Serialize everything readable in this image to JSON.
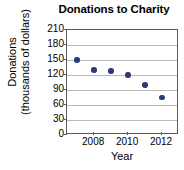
{
  "chart_data": {
    "type": "scatter",
    "title": "Donations to Charity",
    "xlabel": "Year",
    "ylabel": "Donations (thousands of dollars)",
    "ylabel_line1": "Donations",
    "ylabel_line2": "(thousands of dollars)",
    "x": [
      2007,
      2008,
      2009,
      2010,
      2011,
      2012
    ],
    "values": [
      150,
      130,
      128,
      120,
      100,
      75
    ],
    "points": [
      {
        "x": 2007,
        "y": 150
      },
      {
        "x": 2008,
        "y": 130
      },
      {
        "x": 2009,
        "y": 128
      },
      {
        "x": 2010,
        "y": 120
      },
      {
        "x": 2011,
        "y": 100
      },
      {
        "x": 2012,
        "y": 75
      }
    ],
    "ylim": [
      0,
      210
    ],
    "xlim": [
      2006.4,
      2013.0
    ],
    "yticks": [
      0,
      30,
      60,
      90,
      120,
      150,
      180,
      210
    ],
    "ytick_labels": [
      "0",
      "30",
      "60",
      "90",
      "120",
      "150",
      "180",
      "210"
    ],
    "xticks": [
      2008,
      2010,
      2012
    ],
    "xtick_labels": [
      "2008",
      "2010",
      "2012"
    ],
    "grid": true,
    "grid_axis": "y",
    "legend": null,
    "marker_color": "#2c3a78",
    "grid_color": "#b9b9b9",
    "axis_color": "#5a5a5a"
  }
}
